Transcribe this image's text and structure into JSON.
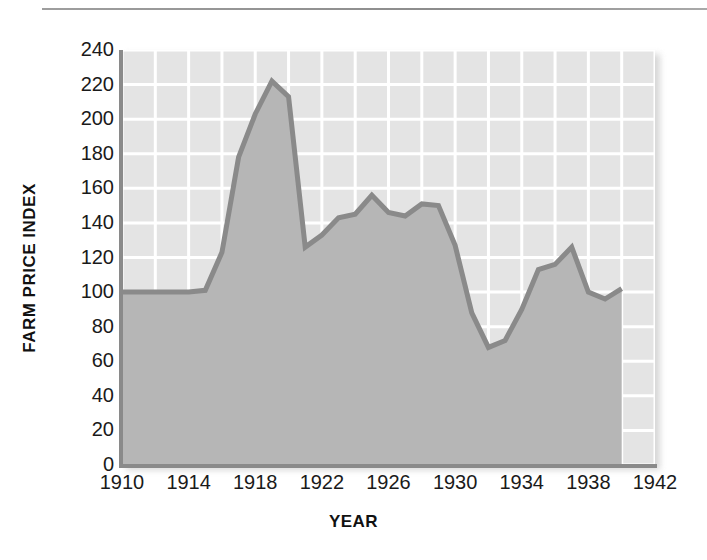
{
  "figure": {
    "top_rule": "horizontal-rule",
    "colors": {
      "plot_background": "#e4e4e4",
      "area_fill": "#b6b6b6",
      "line": "#8a8a8a",
      "gridline": "#ffffff",
      "axis": "#8a8a8a",
      "text": "#1a1a1a",
      "page_background": "#ffffff"
    }
  },
  "chart_data": {
    "type": "area",
    "title": "",
    "subtitle": "",
    "xlabel": "YEAR",
    "ylabel": "FARM PRICE INDEX",
    "xlim": [
      1910,
      1942
    ],
    "ylim": [
      0,
      240
    ],
    "xticks": [
      1910,
      1914,
      1918,
      1922,
      1926,
      1930,
      1934,
      1938,
      1942
    ],
    "xtick_labels": [
      "1910",
      "1914",
      "1918",
      "1922",
      "1926",
      "1930",
      "1934",
      "1938",
      "1942"
    ],
    "yticks": [
      0,
      20,
      40,
      60,
      80,
      100,
      120,
      140,
      160,
      180,
      200,
      220,
      240
    ],
    "ytick_labels": [
      "0",
      "20",
      "40",
      "60",
      "80",
      "100",
      "120",
      "140",
      "160",
      "180",
      "200",
      "220",
      "240"
    ],
    "x_minor_step": 2,
    "y_minor_step": 20,
    "grid": true,
    "grid_color": "#ffffff",
    "legend": null,
    "legend_position": "none",
    "series": [
      {
        "name": "Farm Price Index",
        "fill": "#b6b6b6",
        "line_color": "#8a8a8a",
        "x": [
          1910,
          1911,
          1912,
          1913,
          1914,
          1915,
          1916,
          1917,
          1918,
          1919,
          1920,
          1921,
          1922,
          1923,
          1924,
          1925,
          1926,
          1927,
          1928,
          1929,
          1930,
          1931,
          1932,
          1933,
          1934,
          1935,
          1936,
          1937,
          1938,
          1939,
          1940
        ],
        "values": [
          100,
          100,
          100,
          100,
          100,
          101,
          123,
          178,
          203,
          222,
          213,
          126,
          133,
          143,
          145,
          156,
          146,
          144,
          151,
          150,
          127,
          88,
          68,
          72,
          90,
          113,
          116,
          126,
          100,
          96,
          102
        ]
      }
    ],
    "annotations": []
  }
}
